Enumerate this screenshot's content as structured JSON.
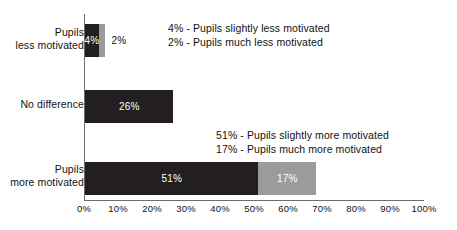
{
  "chart_data": {
    "type": "bar",
    "orientation": "horizontal",
    "stacked": true,
    "title": "",
    "xlabel": "",
    "ylabel": "",
    "xlim": [
      0,
      100
    ],
    "xticks": [
      "0%",
      "10%",
      "20%",
      "30%",
      "40%",
      "50%",
      "60%",
      "70%",
      "80%",
      "90%",
      "100%"
    ],
    "xtick_values": [
      0,
      10,
      20,
      30,
      40,
      50,
      60,
      70,
      80,
      90,
      100
    ],
    "grid": false,
    "legend": "none",
    "categories": [
      "Pupils\nless motivated",
      "No difference",
      "Pupils\nmore motivated"
    ],
    "category_lines": [
      [
        "Pupils",
        "less motivated"
      ],
      [
        "No difference"
      ],
      [
        "Pupils",
        "more motivated"
      ]
    ],
    "series": [
      {
        "name": "slightly",
        "values": [
          4,
          26,
          51
        ]
      },
      {
        "name": "much",
        "values": [
          2,
          0,
          17
        ]
      }
    ],
    "bars": [
      {
        "category": "Pupils less motivated",
        "segments": [
          {
            "value": 4,
            "label": "4%",
            "color": "#231f20",
            "label_inside": true
          },
          {
            "value": 2,
            "label": "2%",
            "color": "#9b9b9b",
            "label_inside": false
          }
        ]
      },
      {
        "category": "No difference",
        "segments": [
          {
            "value": 26,
            "label": "26%",
            "color": "#231f20",
            "label_inside": true
          }
        ]
      },
      {
        "category": "Pupils more motivated",
        "segments": [
          {
            "value": 51,
            "label": "51%",
            "color": "#231f20",
            "label_inside": true
          },
          {
            "value": 17,
            "label": "17%",
            "color": "#9b9b9b",
            "label_inside": true
          }
        ]
      }
    ],
    "annotations": [
      {
        "lines": [
          "4% - Pupils slightly less motivated",
          "2% - Pupils much less motivated"
        ]
      },
      {
        "lines": [
          "51% - Pupils slightly more motivated",
          "17% - Pupils much more motivated"
        ]
      }
    ],
    "colors": {
      "dark": "#231f20",
      "gray": "#9b9b9b",
      "axis": "#6d6d6d",
      "text": "#111111",
      "value_text_inside": "#ffffff",
      "background": "#ffffff"
    }
  }
}
